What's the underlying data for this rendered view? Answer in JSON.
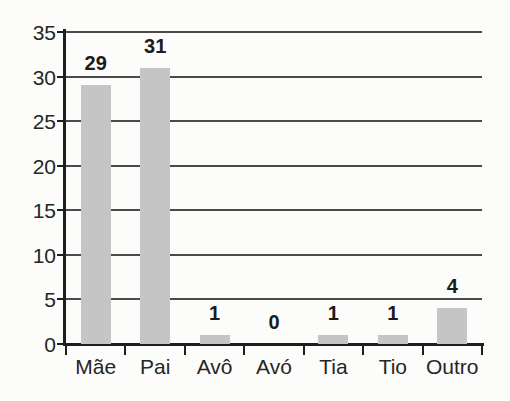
{
  "chart_data": {
    "type": "bar",
    "title": "",
    "xlabel": "",
    "ylabel": "",
    "categories": [
      "Mãe",
      "Pai",
      "Avô",
      "Avó",
      "Tia",
      "Tio",
      "Outro"
    ],
    "values": [
      29,
      31,
      1,
      0,
      1,
      1,
      4
    ],
    "value_labels": [
      "29",
      "31",
      "1",
      "0",
      "1",
      "1",
      "4"
    ],
    "yticks": [
      "0",
      "5",
      "10",
      "15",
      "20",
      "25",
      "30",
      "35"
    ],
    "ytick_values": [
      0,
      5,
      10,
      15,
      20,
      25,
      30,
      35
    ],
    "ylim": [
      0,
      35
    ],
    "grid": "horizontal",
    "legend": "none",
    "colors": {
      "background": "#fcfcfa",
      "bar_fill": "#c5c5c5",
      "gridline": "#4b4b4b",
      "axis": "#1e1e1e",
      "tick_text": "#262626",
      "value_text": "#1b1b1b"
    }
  }
}
